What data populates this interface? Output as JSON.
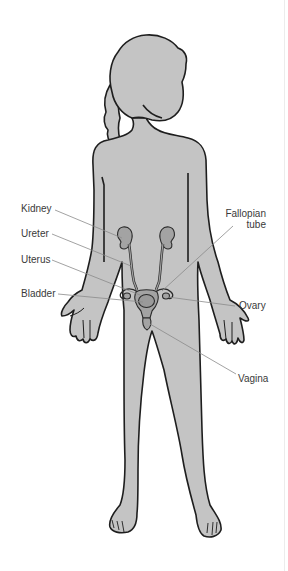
{
  "diagram": {
    "title": "",
    "colors": {
      "body_fill": "#c4c4c4",
      "body_outline": "#1e1e1e",
      "organ_fill": "#a3a3a3",
      "organ_outline": "#2a2a2a",
      "leader_line": "#8a8a8a",
      "label_text": "#3a3a3a",
      "background": "#ffffff"
    },
    "labels": {
      "kidney": "Kidney",
      "ureter": "Ureter",
      "uterus": "Uterus",
      "bladder": "Bladder",
      "fallopian_line1": "Fallopian",
      "fallopian_line2": "tube",
      "ovary": "Ovary",
      "vagina": "Vagina"
    }
  }
}
